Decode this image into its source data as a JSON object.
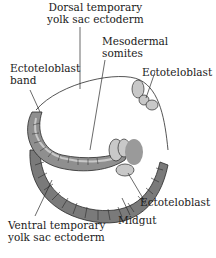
{
  "labels": {
    "dorsal_line1": "Dorsal temporary",
    "dorsal_line2": "yolk sac ectoderm",
    "mesodermal_line1": "Mesodermal",
    "mesodermal_line2": "somites",
    "ectoteloblast_band_line1": "Ectoteloblast",
    "ectoteloblast_band_line2": "band",
    "ectoteloblast_top": "Ectoteloblast",
    "ectoteloblast_bottom": "Ectoteloblast",
    "midgut": "Midgut",
    "ventral_line1": "Ventral temporary",
    "ventral_line2": "yolk sac ectoderm"
  },
  "colors": {
    "dark_gray": "#7a7a7a",
    "medium_gray": "#9a9a9a",
    "light_gray": "#c8c8c8",
    "outline": "#2a2a2a"
  }
}
